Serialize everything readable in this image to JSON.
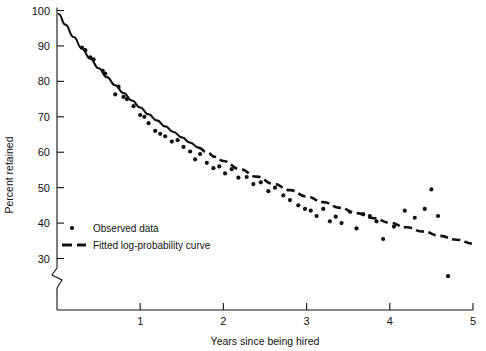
{
  "chart_data": {
    "type": "scatter",
    "title": "",
    "xlabel": "Years since being hired",
    "ylabel": "Percent retained",
    "xlim": [
      0,
      5
    ],
    "ylim": [
      30,
      100
    ],
    "xticks": [
      "1",
      "2",
      "3",
      "4",
      "5"
    ],
    "xtick_values": [
      1,
      2,
      3,
      4,
      5
    ],
    "yticks": [
      "30",
      "40",
      "50",
      "60",
      "70",
      "80",
      "90",
      "100"
    ],
    "ytick_values": [
      30,
      40,
      50,
      60,
      70,
      80,
      90,
      100
    ],
    "grid": false,
    "y_axis_break": true,
    "y_axis_break_note": "axis broken below 30",
    "legend_position": "inside-lower-left",
    "legend": [
      {
        "key": "observed",
        "label": "Observed data",
        "marker": "dot"
      },
      {
        "key": "fitted",
        "label": "Fitted log-probability curve",
        "marker": "dashed-line"
      }
    ],
    "series": [
      {
        "name": "Observed data",
        "type": "scatter",
        "marker": "dot",
        "points": [
          [
            0.3,
            89.5
          ],
          [
            0.34,
            88.8
          ],
          [
            0.4,
            86.8
          ],
          [
            0.44,
            86.2
          ],
          [
            0.55,
            83.0
          ],
          [
            0.58,
            82.2
          ],
          [
            0.7,
            76.3
          ],
          [
            0.74,
            78.5
          ],
          [
            0.8,
            75.6
          ],
          [
            0.84,
            75.0
          ],
          [
            0.92,
            73.0
          ],
          [
            1.0,
            70.5
          ],
          [
            1.05,
            70.0
          ],
          [
            1.1,
            68.2
          ],
          [
            1.18,
            66.0
          ],
          [
            1.24,
            65.2
          ],
          [
            1.3,
            64.5
          ],
          [
            1.38,
            63.0
          ],
          [
            1.45,
            63.4
          ],
          [
            1.52,
            61.5
          ],
          [
            1.6,
            60.2
          ],
          [
            1.66,
            58.0
          ],
          [
            1.72,
            59.5
          ],
          [
            1.8,
            57.0
          ],
          [
            1.88,
            55.5
          ],
          [
            1.95,
            56.0
          ],
          [
            2.02,
            54.0
          ],
          [
            2.1,
            55.2
          ],
          [
            2.18,
            52.8
          ],
          [
            2.28,
            53.0
          ],
          [
            2.36,
            51.0
          ],
          [
            2.45,
            51.5
          ],
          [
            2.54,
            49.0
          ],
          [
            2.62,
            50.0
          ],
          [
            2.72,
            47.8
          ],
          [
            2.8,
            46.5
          ],
          [
            2.9,
            45.0
          ],
          [
            2.98,
            44.0
          ],
          [
            3.05,
            43.5
          ],
          [
            3.12,
            42.0
          ],
          [
            3.2,
            44.0
          ],
          [
            3.28,
            40.5
          ],
          [
            3.35,
            41.8
          ],
          [
            3.42,
            40.0
          ],
          [
            3.52,
            43.2
          ],
          [
            3.6,
            38.5
          ],
          [
            3.68,
            42.5
          ],
          [
            3.76,
            42.0
          ],
          [
            3.84,
            40.5
          ],
          [
            3.92,
            35.5
          ],
          [
            4.05,
            39.0
          ],
          [
            4.18,
            43.5
          ],
          [
            4.3,
            41.5
          ],
          [
            4.42,
            44.0
          ],
          [
            4.5,
            49.5
          ],
          [
            4.58,
            42.0
          ],
          [
            4.7,
            25.0
          ]
        ]
      },
      {
        "name": "Fitted log-probability curve",
        "type": "line",
        "style": "dashed",
        "points": [
          [
            0.02,
            99.0
          ],
          [
            0.1,
            96.0
          ],
          [
            0.2,
            92.5
          ],
          [
            0.3,
            89.3
          ],
          [
            0.4,
            86.4
          ],
          [
            0.5,
            83.7
          ],
          [
            0.6,
            81.2
          ],
          [
            0.7,
            78.9
          ],
          [
            0.8,
            76.7
          ],
          [
            0.9,
            74.6
          ],
          [
            1.0,
            72.6
          ],
          [
            1.1,
            70.7
          ],
          [
            1.2,
            69.0
          ],
          [
            1.3,
            67.3
          ],
          [
            1.4,
            65.7
          ],
          [
            1.5,
            64.2
          ],
          [
            1.6,
            62.7
          ],
          [
            1.7,
            61.3
          ],
          [
            1.8,
            60.0
          ],
          [
            1.9,
            58.7
          ],
          [
            2.0,
            57.5
          ],
          [
            2.2,
            55.2
          ],
          [
            2.4,
            53.1
          ],
          [
            2.6,
            51.1
          ],
          [
            2.8,
            49.3
          ],
          [
            3.0,
            47.5
          ],
          [
            3.2,
            45.9
          ],
          [
            3.4,
            44.3
          ],
          [
            3.6,
            42.8
          ],
          [
            3.8,
            41.4
          ],
          [
            4.0,
            40.1
          ],
          [
            4.2,
            38.8
          ],
          [
            4.4,
            37.6
          ],
          [
            4.6,
            36.4
          ],
          [
            4.8,
            35.3
          ],
          [
            5.0,
            34.2
          ]
        ]
      }
    ]
  }
}
